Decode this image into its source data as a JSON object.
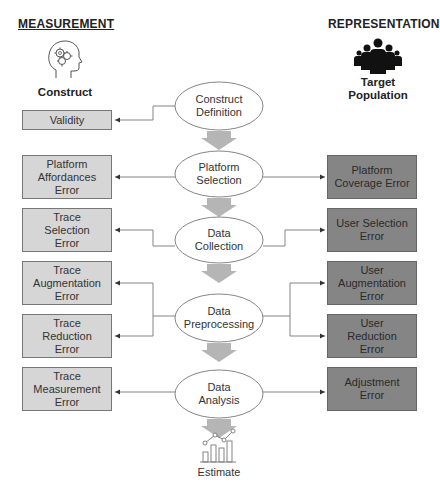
{
  "headings": {
    "measurement": "MEASUREMENT",
    "representation": "REPRESENTATION"
  },
  "icons": {
    "construct": {
      "icon": "head-gears-icon",
      "label": "Construct"
    },
    "target_population": {
      "icon": "people-group-icon",
      "label_line1": "Target",
      "label_line2": "Population"
    },
    "estimate": {
      "icon": "bar-line-chart-icon",
      "label": "Estimate"
    }
  },
  "stages": [
    {
      "line1": "Construct",
      "line2": "Definition"
    },
    {
      "line1": "Platform",
      "line2": "Selection"
    },
    {
      "line1": "Data",
      "line2": "Collection"
    },
    {
      "line1": "Data",
      "line2": "Preprocessing"
    },
    {
      "line1": "Data",
      "line2": "Analysis"
    }
  ],
  "measurement_errors": [
    {
      "lines": [
        "Validity"
      ]
    },
    {
      "lines": [
        "Platform",
        "Affordances",
        "Error"
      ]
    },
    {
      "lines": [
        "Trace",
        "Selection",
        "Error"
      ]
    },
    {
      "lines": [
        "Trace",
        "Augmentation",
        "Error"
      ]
    },
    {
      "lines": [
        "Trace",
        "Reduction",
        "Error"
      ]
    },
    {
      "lines": [
        "Trace",
        "Measurement",
        "Error"
      ]
    }
  ],
  "representation_errors": [
    {
      "lines": [
        "Platform",
        "Coverage Error"
      ]
    },
    {
      "lines": [
        "User Selection",
        "Error"
      ]
    },
    {
      "lines": [
        "User",
        "Augmentation",
        "Error"
      ]
    },
    {
      "lines": [
        "User",
        "Reduction",
        "Error"
      ]
    },
    {
      "lines": [
        "Adjustment",
        "Error"
      ]
    }
  ],
  "colors": {
    "measurement_box": "#d6d6d6",
    "representation_box": "#858585",
    "flow_arrow": "#b5b5b5",
    "connector": "#777777"
  }
}
